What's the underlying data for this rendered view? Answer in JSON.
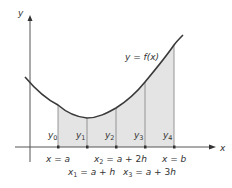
{
  "diagram": {
    "type": "numerical-integration",
    "axes": {
      "x_label": "x",
      "y_label": "y"
    },
    "curve_label": "y = f(x)",
    "ordinates": [
      "y0",
      "y1",
      "y2",
      "y3",
      "y4"
    ],
    "x_labels_top": [
      {
        "text": "x = a"
      },
      {
        "text": "x2 = a + 2h"
      },
      {
        "text": "x = b"
      }
    ],
    "x_labels_bottom": [
      {
        "text": "x1 = a + h"
      },
      {
        "text": "x3 = a + 3h"
      }
    ],
    "colors": {
      "curve": "#3a3a3a",
      "fill": "#e4e4e4",
      "axis": "#555555",
      "gridline": "#888888"
    }
  }
}
